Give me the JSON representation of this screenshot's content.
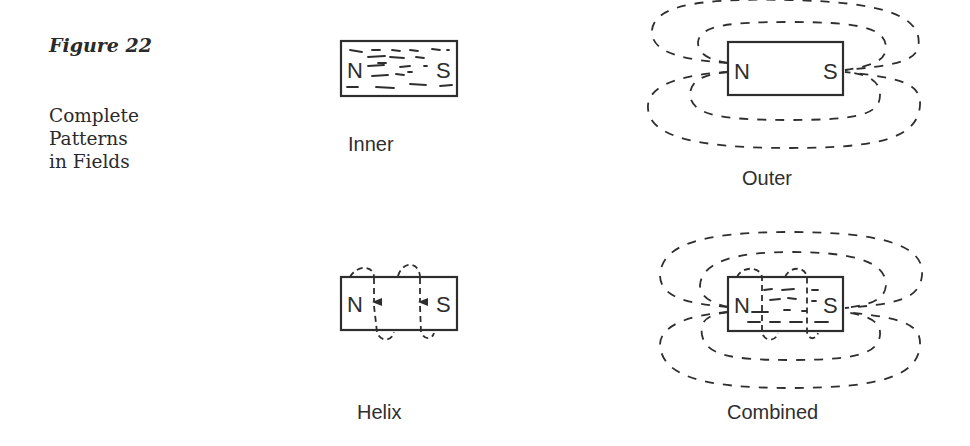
{
  "caption": {
    "figure_label": "Figure 22",
    "title_lines": [
      "Complete",
      "Patterns",
      "in Fields"
    ]
  },
  "panels": [
    {
      "id": "inner",
      "label": "Inner",
      "north_pole": "N",
      "south_pole": "S"
    },
    {
      "id": "outer",
      "label": "Outer",
      "north_pole": "N",
      "south_pole": "S"
    },
    {
      "id": "helix",
      "label": "Helix",
      "north_pole": "N",
      "south_pole": "S"
    },
    {
      "id": "combined",
      "label": "Combined",
      "north_pole": "N",
      "south_pole": "S"
    }
  ],
  "colors": {
    "ink": "#2e2e2e",
    "background": "#ffffff"
  }
}
